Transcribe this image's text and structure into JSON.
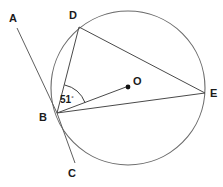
{
  "figure": {
    "type": "circle-geometry-diagram",
    "canvas": {
      "width": 223,
      "height": 187
    },
    "circle": {
      "name": "main-circle",
      "center_x": 128,
      "center_y": 88,
      "radius": 77,
      "color": "#6b6b6b"
    },
    "center_point": {
      "label": "O",
      "x": 128,
      "y": 87,
      "label_x": 133,
      "label_y": 85
    },
    "points": [
      {
        "label": "B",
        "x": 57,
        "y": 113,
        "label_x": 43,
        "label_y": 121,
        "on_circle": true
      },
      {
        "label": "D",
        "x": 79,
        "y": 27,
        "label_x": 73,
        "label_y": 19,
        "on_circle": true
      },
      {
        "label": "E",
        "x": 205,
        "y": 93,
        "label_x": 210,
        "label_y": 97,
        "on_circle": true
      }
    ],
    "ray_endpoints": [
      {
        "label": "A",
        "x": 17,
        "y": 28,
        "label_x": 9,
        "label_y": 22
      },
      {
        "label": "C",
        "x": 75,
        "y": 163,
        "label_x": 72,
        "label_y": 177
      }
    ],
    "segments": [
      {
        "name": "chord-BD",
        "from": "B",
        "to": "D"
      },
      {
        "name": "chord-DE",
        "from": "D",
        "to": "E"
      },
      {
        "name": "chord-BE",
        "from": "B",
        "to": "E"
      },
      {
        "name": "radius-BO",
        "from": "B",
        "to": "O"
      },
      {
        "name": "ray-AB",
        "from": "A",
        "to": "B"
      },
      {
        "name": "ray-BC",
        "from": "B",
        "to": "C"
      }
    ],
    "angle": {
      "name": "angle-DBE",
      "vertex": "B",
      "value": "51",
      "degree_symbol": "°",
      "label_x": 60,
      "label_y": 103,
      "arc_radius": 29
    }
  }
}
